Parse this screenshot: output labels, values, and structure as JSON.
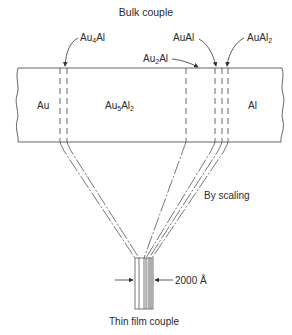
{
  "title": "Bulk couple",
  "footer": "Thin film couple",
  "annotation": "By scaling",
  "dimension": "2000 Å",
  "phases": {
    "au": "Au",
    "au5al2": {
      "base": "Au",
      "sub1": "5",
      "mid": "Al",
      "sub2": "2"
    },
    "al": "Al"
  },
  "callouts": {
    "au4al": {
      "base": "Au",
      "sub": "4",
      "tail": "Al"
    },
    "au2al": {
      "base": "Au",
      "sub": "2",
      "tail": "Al"
    },
    "aual": "AuAl",
    "aual2": {
      "base": "AuAl",
      "sub": "2"
    }
  },
  "colors": {
    "line": "#4a4a4a",
    "text": "#2a2a2a",
    "background": "#ffffff"
  }
}
